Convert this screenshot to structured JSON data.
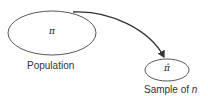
{
  "diagram": {
    "population": {
      "symbol": "π",
      "label": "Population"
    },
    "sample": {
      "symbol": "π̂",
      "label_prefix": "Sample of ",
      "label_var": "n"
    },
    "colors": {
      "stroke": "#333333",
      "text": "#333333"
    }
  }
}
